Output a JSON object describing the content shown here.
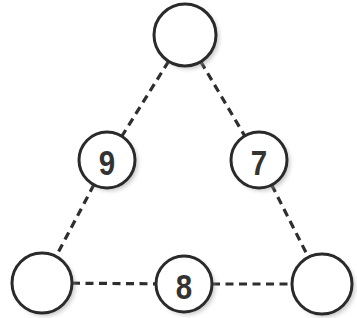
{
  "diagram": {
    "type": "number-triangle-puzzle",
    "nodes": [
      {
        "id": "top",
        "label": ""
      },
      {
        "id": "left-mid",
        "label": "9"
      },
      {
        "id": "right-mid",
        "label": "7"
      },
      {
        "id": "bottom-left",
        "label": ""
      },
      {
        "id": "bottom-mid",
        "label": "8"
      },
      {
        "id": "bottom-right",
        "label": ""
      }
    ],
    "edges": [
      {
        "from": "top",
        "to": "left-mid",
        "style": "dashed"
      },
      {
        "from": "top",
        "to": "right-mid",
        "style": "dashed"
      },
      {
        "from": "left-mid",
        "to": "bottom-left",
        "style": "dashed"
      },
      {
        "from": "right-mid",
        "to": "bottom-right",
        "style": "dashed"
      },
      {
        "from": "bottom-left",
        "to": "bottom-mid",
        "style": "dashed"
      },
      {
        "from": "bottom-mid",
        "to": "bottom-right",
        "style": "dashed"
      }
    ],
    "colors": {
      "stroke": "#2a2a2a",
      "text": "#333333",
      "fill": "#ffffff"
    }
  }
}
